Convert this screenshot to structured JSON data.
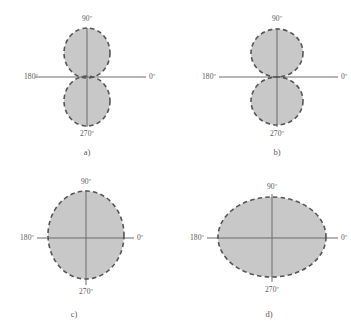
{
  "figure": {
    "type": "polar-radiation-pattern-diagram",
    "background_color": "#ffffff",
    "shape_fill_color": "#c8c8c8",
    "shape_outline_color": "#555555",
    "axis_color": "#6b6b6b",
    "text_color": "#5a5a5a",
    "angle_labels": {
      "top": "90º",
      "right": "0º",
      "bottom": "270º",
      "left": "180º"
    },
    "panels": [
      {
        "id": "a",
        "caption": "a)",
        "pattern": "figure-eight-two-vertical-lobes",
        "center": {
          "x": 87,
          "y": 77
        },
        "lobes": [
          {
            "cx": 87,
            "cy": 53,
            "rx": 23,
            "ry": 25
          },
          {
            "cx": 87,
            "cy": 101,
            "rx": 23,
            "ry": 25
          }
        ],
        "axis_h": {
          "x1": 35,
          "x2": 146,
          "y": 77
        },
        "axis_v": {
          "y1": 28,
          "y2": 127,
          "x": 87
        },
        "labels": {
          "top": {
            "x": 87,
            "y": 15
          },
          "right": {
            "x": 149,
            "y": 77
          },
          "bottom": {
            "x": 87,
            "y": 130
          },
          "left": {
            "x": 38,
            "y": 77
          }
        },
        "caption_pos": {
          "x": 87,
          "y": 148
        }
      },
      {
        "id": "b",
        "caption": "b)",
        "pattern": "two-tangent-circular-lobes",
        "center": {
          "x": 277,
          "y": 77
        },
        "lobes": [
          {
            "cx": 277,
            "cy": 53,
            "rx": 26,
            "ry": 24
          },
          {
            "cx": 277,
            "cy": 101,
            "rx": 26,
            "ry": 24
          }
        ],
        "axis_h": {
          "x1": 219,
          "x2": 338,
          "y": 77
        },
        "axis_v": {
          "y1": 28,
          "y2": 127,
          "x": 277
        },
        "labels": {
          "top": {
            "x": 277,
            "y": 15
          },
          "right": {
            "x": 341,
            "y": 77
          },
          "bottom": {
            "x": 277,
            "y": 130
          },
          "left": {
            "x": 216,
            "y": 77
          }
        },
        "caption_pos": {
          "x": 277,
          "y": 148
        }
      },
      {
        "id": "c",
        "caption": "c)",
        "pattern": "single-vertical-ellipse",
        "center": {
          "x": 86,
          "y": 238
        },
        "lobes": [
          {
            "cx": 86,
            "cy": 235,
            "rx": 38,
            "ry": 44
          }
        ],
        "axis_h": {
          "x1": 37,
          "x2": 134,
          "y": 238
        },
        "axis_v": {
          "y1": 190,
          "y2": 285,
          "x": 86
        },
        "labels": {
          "top": {
            "x": 86,
            "y": 178
          },
          "right": {
            "x": 137,
            "y": 238
          },
          "bottom": {
            "x": 86,
            "y": 288
          },
          "left": {
            "x": 34,
            "y": 238
          }
        },
        "caption_pos": {
          "x": 74,
          "y": 310
        }
      },
      {
        "id": "d",
        "caption": "d)",
        "pattern": "single-horizontal-ellipse",
        "center": {
          "x": 272,
          "y": 238
        },
        "lobes": [
          {
            "cx": 272,
            "cy": 237,
            "rx": 54,
            "ry": 40
          }
        ],
        "axis_h": {
          "x1": 207,
          "x2": 338,
          "y": 238
        },
        "axis_v": {
          "y1": 194,
          "y2": 282,
          "x": 272
        },
        "labels": {
          "top": {
            "x": 272,
            "y": 183
          },
          "right": {
            "x": 341,
            "y": 238
          },
          "bottom": {
            "x": 272,
            "y": 286
          },
          "left": {
            "x": 204,
            "y": 238
          }
        },
        "caption_pos": {
          "x": 269,
          "y": 310
        }
      }
    ]
  }
}
